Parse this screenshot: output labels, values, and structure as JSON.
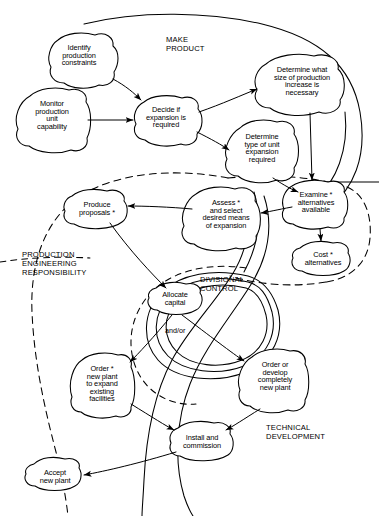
{
  "diagram": {
    "background_color": "#ffffff",
    "stroke_color": "#000000"
  },
  "zones": [
    {
      "id": "make-product",
      "label": "MAKE\nPRODUCT",
      "x": 166,
      "y": 36,
      "style": "solid-open"
    },
    {
      "id": "production-engineering",
      "label": "PRODUCTION\nENGINEERING\nRESPONSIBILITY",
      "x": 22,
      "y": 251,
      "style": "dashed"
    },
    {
      "id": "divisional-control",
      "label": "DIVISIONAL\nCONTROL",
      "x": 200,
      "y": 276,
      "style": "solid"
    },
    {
      "id": "technical-development",
      "label": "TECHNICAL\nDEVELOPMENT",
      "x": 266,
      "y": 424,
      "style": "solid-open"
    }
  ],
  "nodes": [
    {
      "id": "identify-production-constraints",
      "label": "Identify\nproduction\nconstraints",
      "cx": 79,
      "cy": 60,
      "rx": 33,
      "ry": 26,
      "starred": false
    },
    {
      "id": "monitor-production-unit-capability",
      "label": "Monitor\nproduction\nunit\ncapability",
      "cx": 52,
      "cy": 120,
      "rx": 33,
      "ry": 29,
      "starred": false
    },
    {
      "id": "decide-if-expansion-required",
      "label": "Decide if\nexpansion is\nrequired",
      "cx": 166,
      "cy": 118,
      "rx": 32,
      "ry": 22,
      "starred": false
    },
    {
      "id": "determine-size-of-production-increase",
      "label": "Determine what\nsize of production\nincrease is\nnecessary",
      "cx": 302,
      "cy": 84,
      "rx": 44,
      "ry": 27,
      "starred": false
    },
    {
      "id": "determine-type-of-unit-expansion",
      "label": "Determine\ntype of unit\nexpansion\nrequired",
      "cx": 262,
      "cy": 150,
      "rx": 33,
      "ry": 26,
      "starred": false
    },
    {
      "id": "examine-alternatives-available",
      "label": "Examine *\nalternatives\navailable",
      "cx": 316,
      "cy": 203,
      "rx": 33,
      "ry": 21,
      "starred": true
    },
    {
      "id": "cost-alternatives",
      "label": "Cost *\nalternatives",
      "cx": 323,
      "cy": 258,
      "rx": 30,
      "ry": 16,
      "starred": true
    },
    {
      "id": "assess-and-select-means-of-expansion",
      "label": "Assess *\nand select\ndesired means\nof expansion",
      "cx": 226,
      "cy": 215,
      "rx": 38,
      "ry": 26,
      "starred": true
    },
    {
      "id": "produce-proposals",
      "label": "Produce\nproposals *",
      "cx": 97,
      "cy": 209,
      "rx": 33,
      "ry": 18,
      "starred": true
    },
    {
      "id": "allocate-capital",
      "label": "Allocate\ncapital",
      "cx": 175,
      "cy": 299,
      "rx": 28,
      "ry": 16,
      "starred": false
    },
    {
      "id": "order-new-plant-to-expand",
      "label": "Order *\nnew plant\nto expand\nexisting\nfacilities",
      "cx": 102,
      "cy": 385,
      "rx": 30,
      "ry": 30,
      "starred": true
    },
    {
      "id": "order-or-develop-new-plant",
      "label": "Order or\ndevelop\ncompletely\nnew plant",
      "cx": 275,
      "cy": 381,
      "rx": 33,
      "ry": 28,
      "starred": false
    },
    {
      "id": "install-and-commission",
      "label": "Install and\ncommission",
      "cx": 202,
      "cy": 442,
      "rx": 31,
      "ry": 18,
      "starred": false
    },
    {
      "id": "accept-new-plant",
      "label": "Accept\nnew plant",
      "cx": 55,
      "cy": 477,
      "rx": 28,
      "ry": 17,
      "starred": false
    }
  ],
  "connector_labels": [
    {
      "id": "and-or",
      "label": "and/or",
      "x": 165,
      "y": 326
    }
  ],
  "edges": [
    {
      "from": "identify-production-constraints",
      "to": "decide-if-expansion-required"
    },
    {
      "from": "monitor-production-unit-capability",
      "to": "decide-if-expansion-required"
    },
    {
      "from": "decide-if-expansion-required",
      "to": "determine-size-of-production-increase"
    },
    {
      "from": "decide-if-expansion-required",
      "to": "determine-type-of-unit-expansion"
    },
    {
      "from": "determine-size-of-production-increase",
      "to": "examine-alternatives-available"
    },
    {
      "from": "determine-type-of-unit-expansion",
      "to": "examine-alternatives-available"
    },
    {
      "from": "examine-alternatives-available",
      "to": "cost-alternatives"
    },
    {
      "from": "examine-alternatives-available",
      "to": "assess-and-select-means-of-expansion"
    },
    {
      "from": "assess-and-select-means-of-expansion",
      "to": "produce-proposals"
    },
    {
      "from": "produce-proposals",
      "to": "allocate-capital"
    },
    {
      "from": "allocate-capital",
      "to": "order-new-plant-to-expand"
    },
    {
      "from": "allocate-capital",
      "to": "order-or-develop-new-plant"
    },
    {
      "from": "order-new-plant-to-expand",
      "to": "install-and-commission"
    },
    {
      "from": "order-or-develop-new-plant",
      "to": "install-and-commission"
    },
    {
      "from": "install-and-commission",
      "to": "accept-new-plant"
    }
  ]
}
